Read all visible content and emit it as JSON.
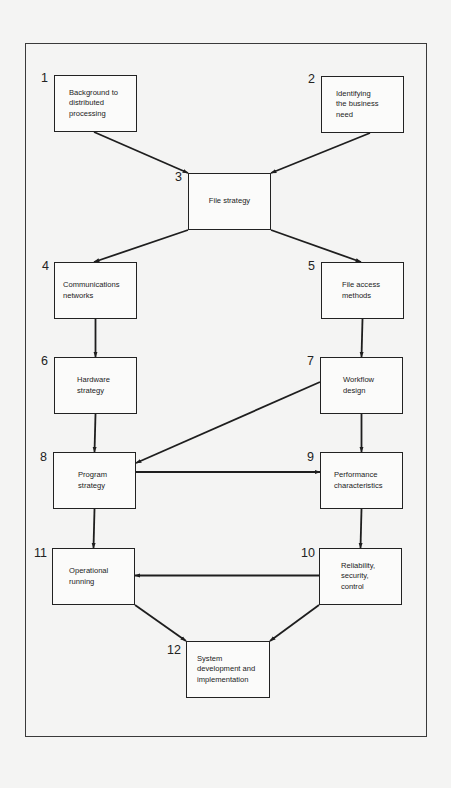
{
  "diagram": {
    "type": "flowchart",
    "nodes": [
      {
        "id": "1",
        "number": "1",
        "label": "Background to\ndistributed\nprocessing"
      },
      {
        "id": "2",
        "number": "2",
        "label": "Identifying\nthe business\nneed"
      },
      {
        "id": "3",
        "number": "3",
        "label": "File strategy"
      },
      {
        "id": "4",
        "number": "4",
        "label": "Communications\nnetworks"
      },
      {
        "id": "5",
        "number": "5",
        "label": "File access\nmethods"
      },
      {
        "id": "6",
        "number": "6",
        "label": "Hardware\nstrategy"
      },
      {
        "id": "7",
        "number": "7",
        "label": "Workflow\ndesign"
      },
      {
        "id": "8",
        "number": "8",
        "label": "Program\nstrategy"
      },
      {
        "id": "9",
        "number": "9",
        "label": "Performance\ncharacteristics"
      },
      {
        "id": "10",
        "number": "10",
        "label": "Reliability,\nsecurity,\ncontrol"
      },
      {
        "id": "11",
        "number": "11",
        "label": "Operational\nrunning"
      },
      {
        "id": "12",
        "number": "12",
        "label": "System\ndevelopment and\nimplementation"
      }
    ],
    "edges": [
      {
        "from": "1",
        "to": "3"
      },
      {
        "from": "2",
        "to": "3"
      },
      {
        "from": "3",
        "to": "4"
      },
      {
        "from": "3",
        "to": "5"
      },
      {
        "from": "4",
        "to": "6"
      },
      {
        "from": "5",
        "to": "7"
      },
      {
        "from": "6",
        "to": "8"
      },
      {
        "from": "7",
        "to": "8"
      },
      {
        "from": "7",
        "to": "9"
      },
      {
        "from": "8",
        "to": "9"
      },
      {
        "from": "8",
        "to": "11"
      },
      {
        "from": "9",
        "to": "10"
      },
      {
        "from": "10",
        "to": "11"
      },
      {
        "from": "11",
        "to": "12"
      },
      {
        "from": "10",
        "to": "12"
      }
    ],
    "colors": {
      "line": "#1e1e1e",
      "box_fill": "#fbfbfa",
      "page_background": "#f4f4f3"
    }
  }
}
